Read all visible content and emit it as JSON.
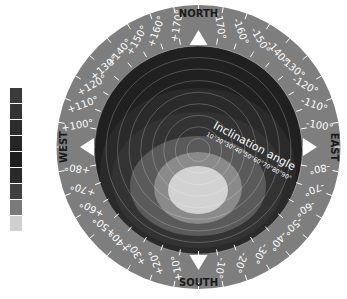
{
  "diagram": {
    "type": "solar-orientation-inclination-chart",
    "compass": {
      "north": "NORTH",
      "south": "SOUTH",
      "east": "EAST",
      "west": "WEST"
    },
    "inclination": {
      "label": "Inclination angle",
      "ticks": [
        "10°",
        "20°",
        "30°",
        "40°",
        "50°",
        "60°",
        "70°",
        "80°",
        "90°"
      ]
    },
    "azimuth_ticks": [
      {
        "angle": 10,
        "label": "+10°"
      },
      {
        "angle": 20,
        "label": "+20°"
      },
      {
        "angle": 30,
        "label": "+30°"
      },
      {
        "angle": 40,
        "label": "+40°"
      },
      {
        "angle": 50,
        "label": "+50°"
      },
      {
        "angle": 60,
        "label": "+60°"
      },
      {
        "angle": 70,
        "label": "+70°"
      },
      {
        "angle": 80,
        "label": "+80°"
      },
      {
        "angle": 100,
        "label": "+100°"
      },
      {
        "angle": 110,
        "label": "+110°"
      },
      {
        "angle": 120,
        "label": "+120°"
      },
      {
        "angle": 130,
        "label": "+130°"
      },
      {
        "angle": 140,
        "label": "+140°"
      },
      {
        "angle": 150,
        "label": "+150°"
      },
      {
        "angle": 160,
        "label": "+160°"
      },
      {
        "angle": 170,
        "label": "+170°"
      },
      {
        "angle": -10,
        "label": "-10°"
      },
      {
        "angle": -20,
        "label": "-20°"
      },
      {
        "angle": -30,
        "label": "-30°"
      },
      {
        "angle": -40,
        "label": "-40°"
      },
      {
        "angle": -50,
        "label": "-50°"
      },
      {
        "angle": -60,
        "label": "-60°"
      },
      {
        "angle": -70,
        "label": "-70°"
      },
      {
        "angle": -80,
        "label": "-80°"
      },
      {
        "angle": -100,
        "label": "-100°"
      },
      {
        "angle": -110,
        "label": "-110°"
      },
      {
        "angle": -120,
        "label": "-120°"
      },
      {
        "angle": -130,
        "label": "-130°"
      },
      {
        "angle": -140,
        "label": "-140°"
      },
      {
        "angle": -150,
        "label": "-150°"
      },
      {
        "angle": -160,
        "label": "-160°"
      },
      {
        "angle": -170,
        "label": "-170°"
      }
    ],
    "legend_colors": [
      "#3a3a3a",
      "#333333",
      "#2c2c2c",
      "#262626",
      "#1f1f1f",
      "#2a2a2a",
      "#404040",
      "#7a7a7a",
      "#cfcfcf"
    ],
    "zones": [
      {
        "cx": 198,
        "cy": 150,
        "rx": 104,
        "ry": 104,
        "color": "#202020"
      },
      {
        "cx": 198,
        "cy": 172,
        "rx": 98,
        "ry": 84,
        "color": "#2a2a2a"
      },
      {
        "cx": 198,
        "cy": 180,
        "rx": 86,
        "ry": 68,
        "color": "#333333"
      },
      {
        "cx": 198,
        "cy": 186,
        "rx": 68,
        "ry": 50,
        "color": "#5a5a5a"
      },
      {
        "cx": 198,
        "cy": 188,
        "rx": 44,
        "ry": 36,
        "color": "#8a8a8a"
      },
      {
        "cx": 198,
        "cy": 190,
        "rx": 30,
        "ry": 24,
        "color": "#d2d2d2"
      }
    ],
    "colors": {
      "ring": "#7e7e7e",
      "ring_text": "#ffffff",
      "compass_text": "#1a1a1a",
      "arrow": "#ffffff"
    }
  }
}
